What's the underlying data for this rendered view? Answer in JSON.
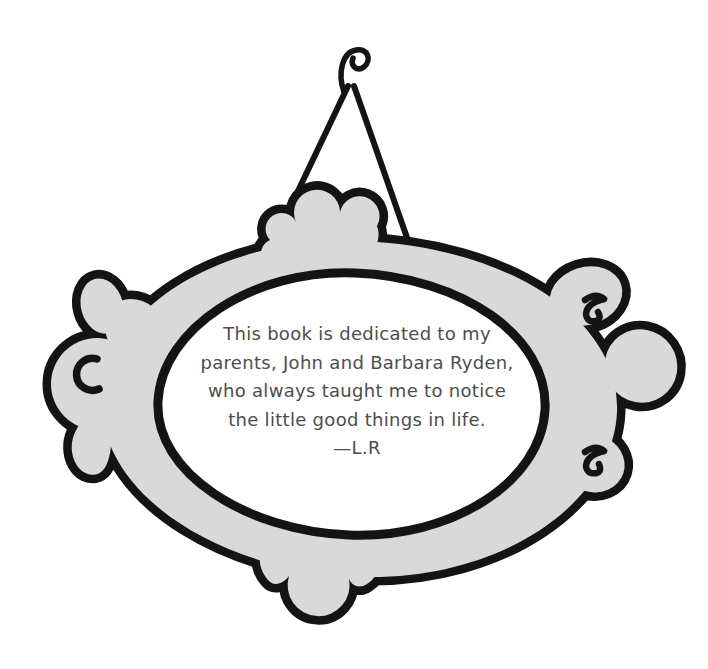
{
  "page": {
    "background_color": "#ffffff"
  },
  "illustration": {
    "name": "hanging-ornate-picture-frame",
    "frame_fill_color": "#d9d9d9",
    "outline_color": "#141414",
    "parts": [
      "hook-icon",
      "hanging-wires",
      "top-crown-ornament",
      "left-flourish-ornament",
      "right-flourish-ornament",
      "bottom-drop-ornament",
      "oval-frame",
      "curl-marks"
    ]
  },
  "dedication": {
    "text_color": "#4d4d4d",
    "lines": [
      "This book is dedicated to my",
      "parents, John and Barbara Ryden,",
      "who always taught me to notice",
      "the little good things in life.",
      "—L.R"
    ]
  }
}
